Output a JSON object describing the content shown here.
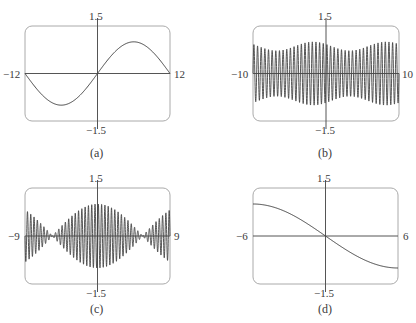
{
  "chart_data": [
    {
      "id": "a",
      "type": "line",
      "caption": "(a)",
      "xlim": [
        -12,
        12
      ],
      "ylim": [
        -1.5,
        1.5
      ],
      "tick_labels": {
        "xmin": "−12",
        "xmax": "12",
        "ymax": "1.5",
        "ymin": "−1.5"
      },
      "function": "sin(pi*x/12)",
      "grid": false,
      "box": {
        "x": 25,
        "y": 26,
        "w": 145,
        "h": 95
      },
      "x": [
        -12,
        -9,
        -6,
        -3,
        0,
        3,
        6,
        9,
        12
      ],
      "y": [
        0,
        -0.71,
        -1.0,
        -0.71,
        0,
        0.71,
        1.0,
        0.71,
        0
      ]
    },
    {
      "id": "b",
      "type": "line",
      "caption": "(b)",
      "xlim": [
        -10,
        10
      ],
      "ylim": [
        -1.5,
        1.5
      ],
      "tick_labels": {
        "xmin": "−10",
        "xmax": "10",
        "ymax": "1.5",
        "ymin": "−1.5"
      },
      "function": "rapid oscillation (~40 cycles) with slowly varying envelope 0.75-1.0",
      "grid": false,
      "box": {
        "x": 253,
        "y": 26,
        "w": 146,
        "h": 95
      },
      "cycles": 40,
      "envelope_min": 0.72,
      "envelope_max": 1.0,
      "envelope_periods": 2
    },
    {
      "id": "c",
      "type": "line",
      "caption": "(c)",
      "xlim": [
        -9,
        9
      ],
      "ylim": [
        -1.5,
        1.5
      ],
      "tick_labels": {
        "xmin": "−9",
        "xmax": "9",
        "ymax": "1.5",
        "ymin": "−1.5"
      },
      "function": "beats: cos(slow)*sin(fast), nodes near x = ±5.5",
      "grid": false,
      "box": {
        "x": 25,
        "y": 188,
        "w": 145,
        "h": 96
      },
      "cycles": 44,
      "envelope_max": 1.0,
      "node_x": [
        -5.6,
        5.6
      ]
    },
    {
      "id": "d",
      "type": "line",
      "caption": "(d)",
      "xlim": [
        -6,
        6
      ],
      "ylim": [
        -1.5,
        1.5
      ],
      "tick_labels": {
        "xmin": "−6",
        "xmax": "6",
        "ymax": "1.5",
        "ymin": "−1.5"
      },
      "function": "-sin(pi*x/12)",
      "grid": false,
      "box": {
        "x": 253,
        "y": 188,
        "w": 145,
        "h": 96
      },
      "x": [
        -6,
        -3,
        0,
        3,
        6
      ],
      "y": [
        1.0,
        0.71,
        0,
        -0.71,
        -1.0
      ]
    }
  ],
  "colors": {
    "axis": "#555555",
    "frame": "#aaaaaa",
    "curve": "#444444"
  }
}
